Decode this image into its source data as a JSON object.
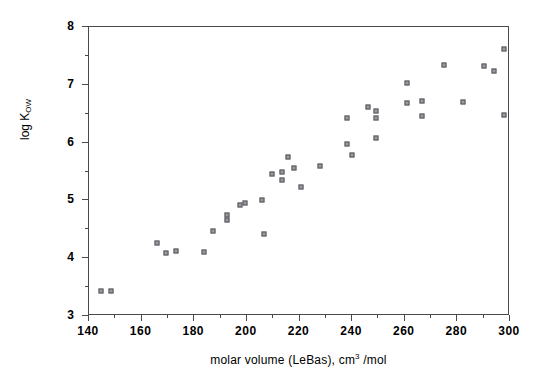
{
  "chart_data": {
    "type": "scatter",
    "title": "",
    "xlabel": "molar volume (LeBas), cm3 /mol",
    "xlabel_main": "molar volume (LeBas), cm",
    "xlabel_sup": "3",
    "xlabel_tail": " /mol",
    "ylabel": "log Kow",
    "ylabel_main": "log K",
    "ylabel_sub": "OW",
    "xlim": [
      140,
      300
    ],
    "ylim": [
      3,
      8
    ],
    "xticks": [
      140,
      160,
      180,
      200,
      220,
      240,
      260,
      280,
      300
    ],
    "xticks_minor": [
      150,
      170,
      190,
      210,
      230,
      250,
      270,
      290
    ],
    "yticks": [
      3,
      4,
      5,
      6,
      7,
      8
    ],
    "yticks_minor": [
      3.5,
      4.5,
      5.5,
      6.5,
      7.5
    ],
    "grid": false,
    "legend": null,
    "marker_fill": "#9a9a9e",
    "marker_edge": "#55555a",
    "axis_color": "#4a4a4a",
    "points": [
      [
        144.8,
        3.41
      ],
      [
        148.6,
        3.42
      ],
      [
        166.1,
        4.24
      ],
      [
        169.6,
        4.07
      ],
      [
        173.4,
        4.11
      ],
      [
        184.1,
        4.09
      ],
      [
        187.6,
        4.45
      ],
      [
        192.7,
        4.73
      ],
      [
        192.7,
        4.64
      ],
      [
        197.8,
        4.91
      ],
      [
        199.7,
        4.94
      ],
      [
        206.2,
        4.99
      ],
      [
        206.8,
        4.4
      ],
      [
        209.8,
        5.44
      ],
      [
        213.6,
        5.47
      ],
      [
        213.6,
        5.33
      ],
      [
        216.1,
        5.74
      ],
      [
        218.4,
        5.54
      ],
      [
        220.8,
        5.22
      ],
      [
        228.2,
        5.57
      ],
      [
        238.6,
        6.4
      ],
      [
        238.6,
        5.95
      ],
      [
        240.5,
        5.77
      ],
      [
        246.5,
        6.6
      ],
      [
        249.5,
        6.53
      ],
      [
        249.5,
        6.41
      ],
      [
        249.5,
        6.06
      ],
      [
        261.1,
        6.67
      ],
      [
        261.3,
        7.01
      ],
      [
        267.0,
        6.7
      ],
      [
        267.0,
        6.45
      ],
      [
        275.3,
        7.32
      ],
      [
        282.6,
        6.69
      ],
      [
        290.4,
        7.31
      ],
      [
        294.2,
        7.22
      ],
      [
        298.1,
        7.61
      ],
      [
        298.1,
        6.46
      ]
    ]
  }
}
